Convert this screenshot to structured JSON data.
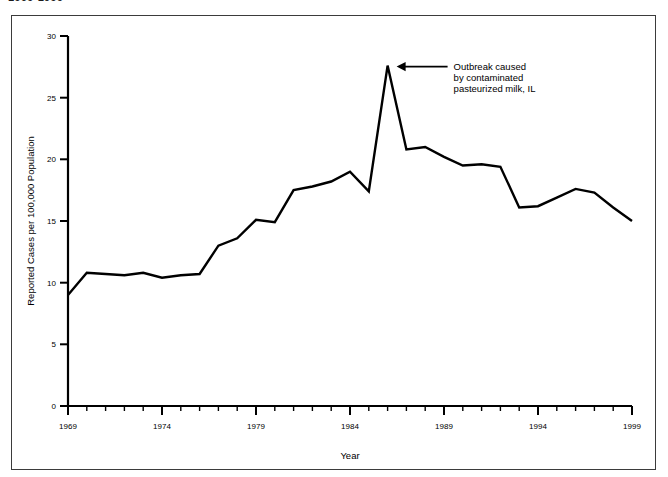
{
  "top_caption": "1969-1999",
  "chart_data": {
    "type": "line",
    "title": "",
    "xlabel": "Year",
    "ylabel": "Reported Cases per 100,000 Population",
    "xlim": [
      1969,
      1999
    ],
    "ylim": [
      0,
      30
    ],
    "ytick_step": 5,
    "yticks": [
      0,
      5,
      10,
      15,
      20,
      25,
      30
    ],
    "ytick_labels": [
      "0",
      "5",
      "10",
      "15",
      "20",
      "25",
      "30"
    ],
    "xticks_major": [
      1969,
      1974,
      1979,
      1984,
      1989,
      1994,
      1999
    ],
    "xtick_labels": [
      "1969",
      "1974",
      "1979",
      "1984",
      "1989",
      "1994",
      "1999"
    ],
    "xtick_minor_step": 1,
    "grid": false,
    "legend": "none",
    "line_color": "#000000",
    "x": [
      1969,
      1970,
      1971,
      1972,
      1973,
      1974,
      1975,
      1976,
      1977,
      1978,
      1979,
      1980,
      1981,
      1982,
      1983,
      1984,
      1985,
      1986,
      1987,
      1988,
      1989,
      1990,
      1991,
      1992,
      1993,
      1994,
      1995,
      1996,
      1997,
      1998,
      1999
    ],
    "values": [
      9.0,
      10.8,
      10.7,
      10.6,
      10.8,
      10.4,
      10.6,
      10.7,
      13.0,
      13.6,
      15.1,
      14.9,
      17.5,
      17.8,
      18.2,
      19.0,
      17.4,
      27.6,
      20.8,
      21.0,
      20.2,
      19.5,
      19.6,
      19.4,
      16.1,
      16.2,
      16.9,
      17.6,
      17.3,
      16.1,
      15.0
    ],
    "annotations": [
      {
        "target_year": 1986,
        "target_value": 27.6,
        "arrow": "left-pointing-arrow",
        "lines": [
          "Outbreak caused",
          "by contaminated",
          "pasteurized milk, IL"
        ]
      }
    ]
  }
}
